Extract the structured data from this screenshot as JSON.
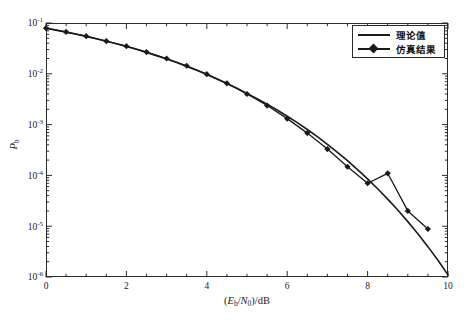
{
  "chart_data": {
    "type": "line",
    "title": "",
    "xlabel": "(Eb/N0)/dB",
    "ylabel": "Pb",
    "xlim": [
      0,
      10
    ],
    "ylim": [
      1e-06,
      0.1
    ],
    "yscale": "log",
    "grid": false,
    "legend_position": "upper right",
    "xticks": [
      "0",
      "2",
      "4",
      "6",
      "8",
      "10"
    ],
    "xtick_values": [
      0,
      2,
      4,
      6,
      8,
      10
    ],
    "yticks": [
      "10-1",
      "10-2",
      "10-3",
      "10-4",
      "10-5",
      "10-6"
    ],
    "ytick_values": [
      0.1,
      0.01,
      0.001,
      0.0001,
      1e-05,
      1e-06
    ],
    "ytick_mantissa": [
      "10",
      "10",
      "10",
      "10",
      "10",
      "10"
    ],
    "ytick_exponent": [
      "-1",
      "-2",
      "-3",
      "-4",
      "-5",
      "-6"
    ],
    "series": [
      {
        "name": "理论值",
        "style": "solid-line",
        "marker": "none",
        "color": "#1a1a1a",
        "x": [
          0,
          0.25,
          0.5,
          0.75,
          1,
          1.25,
          1.5,
          1.75,
          2,
          2.25,
          2.5,
          2.75,
          3,
          3.25,
          3.5,
          3.75,
          4,
          4.25,
          4.5,
          4.75,
          5,
          5.25,
          5.5,
          5.75,
          6,
          6.25,
          6.5,
          6.75,
          7,
          7.25,
          7.5,
          7.75,
          8,
          8.25,
          8.5,
          8.75,
          9,
          9.25,
          9.5,
          9.75,
          10
        ],
        "y": [
          0.0786,
          0.0723,
          0.0661,
          0.0601,
          0.0545,
          0.0491,
          0.0439,
          0.0391,
          0.0345,
          0.0303,
          0.0264,
          0.0228,
          0.0195,
          0.0166,
          0.014,
          0.0117,
          0.00968,
          0.00793,
          0.00644,
          0.00518,
          0.00412,
          0.00325,
          0.00252,
          0.00194,
          0.00146,
          0.00109,
          0.0008,
          0.000578,
          0.00041,
          0.000285,
          0.000195,
          0.00013,
          8.52e-05,
          5.46e-05,
          3.41e-05,
          2.08e-05,
          1.23e-05,
          7.1e-06,
          3.96e-06,
          2.13e-06,
          1.1e-06
        ]
      },
      {
        "name": "仿真结果",
        "style": "solid-line-markers",
        "marker": "diamond",
        "color": "#1a1a1a",
        "x": [
          0,
          0.5,
          1,
          1.5,
          2,
          2.5,
          3,
          3.5,
          4,
          4.5,
          5,
          5.5,
          6,
          6.5,
          7,
          7.5,
          8,
          8.5,
          9,
          9.5
        ],
        "y": [
          0.079,
          0.0668,
          0.055,
          0.0441,
          0.0349,
          0.0268,
          0.02,
          0.0144,
          0.00985,
          0.00648,
          0.004,
          0.00237,
          0.00131,
          0.00068,
          0.00033,
          0.000148,
          7e-05,
          0.00011,
          2e-05,
          8.8e-06
        ]
      }
    ],
    "annotations": []
  },
  "legend": {
    "items": [
      {
        "label": "理论值",
        "marker": "none"
      },
      {
        "label": "仿真结果",
        "marker": "diamond"
      }
    ]
  },
  "axis_titles": {
    "x_prefix": "(",
    "x_e": "E",
    "x_e_sub": "b",
    "x_slash": "/",
    "x_n": "N",
    "x_n_sub": "0",
    "x_suffix": ")/dB",
    "y_p": "P",
    "y_p_sub": "b"
  }
}
